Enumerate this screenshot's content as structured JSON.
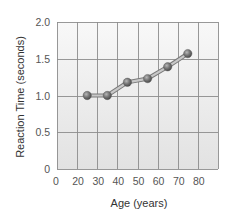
{
  "chart_data": {
    "type": "line",
    "title": "",
    "xlabel": "Age (years)",
    "ylabel": "Reaction Time (seconds)",
    "x_tick_labels": [
      "0",
      "20",
      "30",
      "40",
      "50",
      "60",
      "70",
      "80"
    ],
    "y_tick_labels": [
      "0",
      "0.5",
      "1.0",
      "1.5",
      "2.0"
    ],
    "y_ticks": [
      0,
      0.5,
      1.0,
      1.5,
      2.0
    ],
    "ylim": [
      0,
      2.0
    ],
    "x_axis_note": "broken axis: 0 then 20–90 in 10-year gridlines",
    "grid": true,
    "legend": null,
    "series": [
      {
        "name": "Reaction Time",
        "x": [
          25,
          35,
          45,
          55,
          65,
          75
        ],
        "values": [
          1.0,
          1.0,
          1.18,
          1.23,
          1.39,
          1.57
        ]
      }
    ],
    "colors": {
      "marker": "#6e6e6e",
      "line_fill": "#c8c8c8",
      "line_edge": "#7a7a7a",
      "grid": "#8c8c8c",
      "plot_bg_top": "#f8f8f8",
      "plot_bg_bottom": "#e2e2e2"
    }
  }
}
